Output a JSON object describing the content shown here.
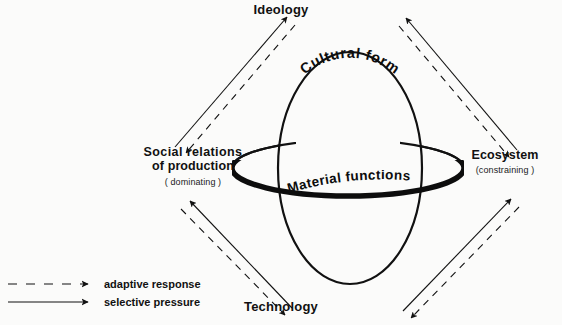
{
  "diagram": {
    "nodes": {
      "ideology": {
        "label": "Ideology"
      },
      "ecosystem": {
        "label": "Ecosystem",
        "qualifier": "(constraining )"
      },
      "technology": {
        "label": "Technology"
      },
      "social": {
        "label_line1": "Social  relations",
        "label_line2": "of production",
        "qualifier": "( dominating )"
      }
    },
    "sphere": {
      "vertical_label": "Cultural form",
      "ring_label": "Material functions"
    },
    "legend": {
      "adaptive": "adaptive response",
      "selective": "selective pressure"
    },
    "colors": {
      "ink": "#111111",
      "background": "#fbfbfa"
    }
  }
}
